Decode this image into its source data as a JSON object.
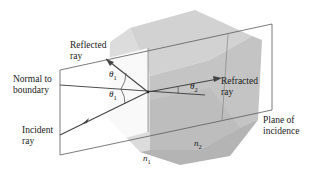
{
  "diagram": {
    "labels": {
      "reflected_ray_line1": "Reflected",
      "reflected_ray_line2": "ray",
      "normal_line1": "Normal to",
      "normal_line2": "boundary",
      "incident_line1": "Incident",
      "incident_line2": "ray",
      "refracted_line1": "Refracted",
      "refracted_line2": "ray",
      "plane_line1": "Plane of",
      "plane_line2": "incidence"
    },
    "symbols": {
      "theta1_upper": "θ",
      "theta1_upper_sub": "1",
      "theta1_lower": "θ",
      "theta1_lower_sub": "1",
      "theta2": "θ",
      "theta2_sub": "2",
      "n1": "n",
      "n1_sub": "1",
      "n2": "n",
      "n2_sub": "2"
    },
    "colors": {
      "line": "#4a4a4a",
      "ray": "#555555",
      "cube_top": "#cfcfcf",
      "cube_left": "#dadada",
      "cube_right": "#bdbdbd",
      "cube_dark": "#a9a9a9",
      "plane_fill": "#ffffff"
    }
  }
}
